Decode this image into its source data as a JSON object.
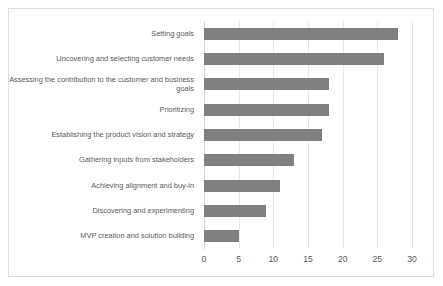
{
  "chart_data": {
    "type": "bar",
    "orientation": "horizontal",
    "title": "",
    "xlabel": "",
    "ylabel": "",
    "xlim": [
      0,
      30
    ],
    "xticks": [
      0,
      5,
      10,
      15,
      20,
      25,
      30
    ],
    "grid": "vertical",
    "legend": "none",
    "bar_color": "#808080",
    "categories": [
      "Setting goals",
      "Uncovering and selecting customer needs",
      "Assessing the contribution to the customer and business goals",
      "Prioritizing",
      "Establishing the product vision and strategy",
      "Gathering inputs from stakeholders",
      "Achieving alignment and buy-in",
      "Discovering and experimenting",
      "MVP creation and solution building"
    ],
    "values": [
      28,
      26,
      18,
      18,
      17,
      13,
      11,
      9,
      5
    ]
  }
}
